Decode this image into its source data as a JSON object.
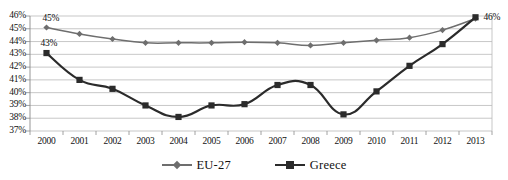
{
  "chart_data": {
    "type": "line",
    "title": "",
    "xlabel": "",
    "ylabel": "",
    "categories": [
      "2000",
      "2001",
      "2002",
      "2003",
      "2004",
      "2005",
      "2006",
      "2007",
      "2008",
      "2009",
      "2010",
      "2011",
      "2012",
      "2013"
    ],
    "ylim": [
      37,
      46
    ],
    "ytick_labels": [
      "37%",
      "38%",
      "39%",
      "40%",
      "41%",
      "42%",
      "43%",
      "44%",
      "45%",
      "46%"
    ],
    "ytick_values": [
      37,
      38,
      39,
      40,
      41,
      42,
      43,
      44,
      45,
      46
    ],
    "grid": true,
    "legend_position": "bottom",
    "series": [
      {
        "name": "EU-27",
        "color": "#6e6e6e",
        "marker": "diamond",
        "values": [
          45.1,
          44.6,
          44.2,
          43.9,
          43.9,
          43.9,
          43.95,
          43.9,
          43.7,
          43.9,
          44.1,
          44.3,
          44.9,
          45.8
        ]
      },
      {
        "name": "Greece",
        "color": "#2b2b2b",
        "marker": "square",
        "values": [
          43.1,
          41.0,
          40.3,
          39.0,
          38.1,
          39.0,
          39.1,
          40.6,
          40.6,
          38.3,
          40.1,
          42.1,
          43.8,
          45.9
        ]
      }
    ],
    "annotations": [
      {
        "text": "45%",
        "series": "EU-27",
        "category": "2000"
      },
      {
        "text": "43%",
        "series": "Greece",
        "category": "2000"
      },
      {
        "text": "46%",
        "series": "Greece",
        "category": "2013"
      }
    ],
    "legend": [
      {
        "label": "EU-27",
        "color": "#6e6e6e",
        "marker": "diamond"
      },
      {
        "label": "Greece",
        "color": "#2b2b2b",
        "marker": "square"
      }
    ]
  }
}
